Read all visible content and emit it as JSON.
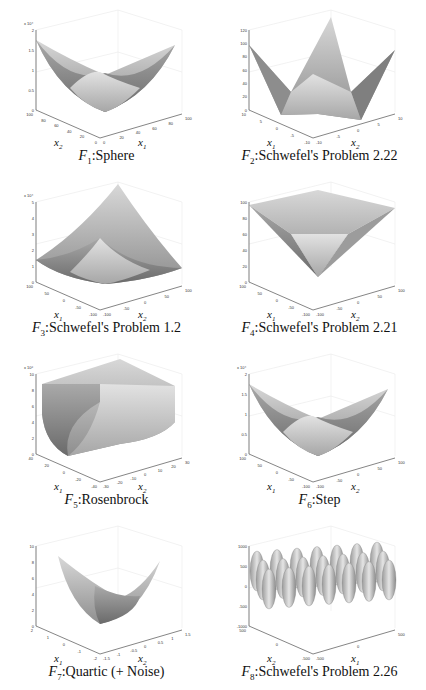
{
  "figure": {
    "panels": [
      {
        "id": "F1",
        "caption_fn": "F",
        "caption_sub": "1",
        "caption_text": ":Sphere",
        "z_exponent_label": "x 10⁴",
        "z_ticks": [
          "0",
          "0.5",
          "1",
          "1.5",
          "2"
        ],
        "left_axis_label": "x",
        "left_axis_sub": "2",
        "right_axis_label": "x",
        "right_axis_sub": "1",
        "left_ticks": [
          "100",
          "80",
          "60",
          "40",
          "20",
          "0"
        ],
        "right_ticks": [
          "0",
          "20",
          "40",
          "60",
          "80",
          "100"
        ],
        "shape": "bowl"
      },
      {
        "id": "F2",
        "caption_fn": "F",
        "caption_sub": "2",
        "caption_text": ":Schwefel's Problem 2.22",
        "z_exponent_label": "",
        "z_ticks": [
          "0",
          "20",
          "40",
          "60",
          "80",
          "100",
          "120"
        ],
        "left_axis_label": "x",
        "left_axis_sub": "1",
        "right_axis_label": "x",
        "right_axis_sub": "2",
        "left_ticks": [
          "10",
          "5",
          "0",
          "-5",
          "-10"
        ],
        "right_ticks": [
          "-10",
          "-5",
          "0",
          "5",
          "10"
        ],
        "shape": "star"
      },
      {
        "id": "F3",
        "caption_fn": "F",
        "caption_sub": "3",
        "caption_text": ":Schwefel's Problem 1.2",
        "z_exponent_label": "x 10⁴",
        "z_ticks": [
          "0",
          "1",
          "2",
          "3",
          "4",
          "5"
        ],
        "left_axis_label": "x",
        "left_axis_sub": "1",
        "right_axis_label": "x",
        "right_axis_sub": "2",
        "left_ticks": [
          "100",
          "50",
          "0",
          "-50",
          "-100"
        ],
        "right_ticks": [
          "-100",
          "-50",
          "0",
          "50",
          "100"
        ],
        "shape": "skewbowl"
      },
      {
        "id": "F4",
        "caption_fn": "F",
        "caption_sub": "4",
        "caption_text": ":Schwefel's Problem 2.21",
        "z_exponent_label": "",
        "z_ticks": [
          "0",
          "20",
          "40",
          "60",
          "80",
          "100"
        ],
        "left_axis_label": "x",
        "left_axis_sub": "1",
        "right_axis_label": "x",
        "right_axis_sub": "2",
        "left_ticks": [
          "100",
          "50",
          "0",
          "-50",
          "-100"
        ],
        "right_ticks": [
          "-100",
          "-50",
          "0",
          "50",
          "100"
        ],
        "shape": "pyramid"
      },
      {
        "id": "F5",
        "caption_fn": "F",
        "caption_sub": "5",
        "caption_text": ":Rosenbrock",
        "z_exponent_label": "x 10⁶",
        "z_ticks": [
          "0",
          "2",
          "4",
          "6",
          "8",
          "10"
        ],
        "left_axis_label": "x",
        "left_axis_sub": "1",
        "right_axis_label": "x",
        "right_axis_sub": "2",
        "left_ticks": [
          "40",
          "20",
          "0",
          "-20",
          "-40"
        ],
        "right_ticks": [
          "-30",
          "-20",
          "-10",
          "0",
          "10",
          "20",
          "30"
        ],
        "shape": "valley"
      },
      {
        "id": "F6",
        "caption_fn": "F",
        "caption_sub": "6",
        "caption_text": ":Step",
        "z_exponent_label": "x 10⁴",
        "z_ticks": [
          "0",
          "0.5",
          "1",
          "1.5",
          "2"
        ],
        "left_axis_label": "x",
        "left_axis_sub": "1",
        "right_axis_label": "x",
        "right_axis_sub": "2",
        "left_ticks": [
          "100",
          "50",
          "0",
          "-50",
          "-100"
        ],
        "right_ticks": [
          "-100",
          "-50",
          "0",
          "50",
          "100"
        ],
        "shape": "bowl"
      },
      {
        "id": "F7",
        "caption_fn": "F",
        "caption_sub": "7",
        "caption_text": ":Quartic (+ Noise)",
        "z_exponent_label": "",
        "z_ticks": [
          "0",
          "2",
          "4",
          "6",
          "8",
          "10"
        ],
        "left_axis_label": "x",
        "left_axis_sub": "1",
        "right_axis_label": "x",
        "right_axis_sub": "2",
        "left_ticks": [
          "2",
          "1",
          "0",
          "-1",
          "-2"
        ],
        "right_ticks": [
          "-1.5",
          "-1",
          "-0.5",
          "0",
          "0.5",
          "1",
          "1.5"
        ],
        "shape": "flatbowl"
      },
      {
        "id": "F8",
        "caption_fn": "F",
        "caption_sub": "8",
        "caption_text": ":Schwefel's Problem 2.26",
        "z_exponent_label": "",
        "z_ticks": [
          "-1000",
          "-500",
          "0",
          "500",
          "1000"
        ],
        "left_axis_label": "x",
        "left_axis_sub": "2",
        "right_axis_label": "x",
        "right_axis_sub": "1",
        "left_ticks": [
          "500",
          "0",
          "-500"
        ],
        "right_ticks": [
          "-500",
          "0",
          "500"
        ],
        "shape": "egg"
      }
    ]
  }
}
